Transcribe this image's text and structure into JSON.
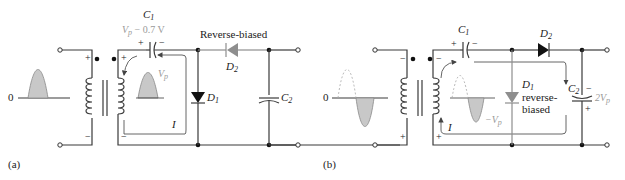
{
  "figure": {
    "panel_a": {
      "label": "(a)",
      "input_zero": "0",
      "primary_top_polarity": "+",
      "primary_bottom_polarity": "−",
      "secondary_top_polarity": "+",
      "secondary_bottom_polarity": "−",
      "c1": {
        "name": "C",
        "sub": "1",
        "voltage_label": "V",
        "voltage_sub": "p",
        "voltage_suffix": " − 0.7 V",
        "plus": "+",
        "minus": "−"
      },
      "vp_label": "V",
      "vp_sub": "p",
      "d1": {
        "name": "D",
        "sub": "1"
      },
      "d2": {
        "name": "D",
        "sub": "2",
        "status": "Reverse-biased"
      },
      "c2": {
        "name": "C",
        "sub": "2"
      },
      "current": "I"
    },
    "panel_b": {
      "label": "(b)",
      "input_zero": "0",
      "primary_top_polarity": "−",
      "primary_bottom_polarity": "+",
      "secondary_top_polarity": "−",
      "secondary_bottom_polarity": "+",
      "c1": {
        "name": "C",
        "sub": "1",
        "plus": "+",
        "minus": "−"
      },
      "neg_vp_label": "−V",
      "neg_vp_sub": "p",
      "d1": {
        "name": "D",
        "sub": "1",
        "status_line1": "reverse-",
        "status_line2": "biased"
      },
      "d2": {
        "name": "D",
        "sub": "2"
      },
      "c2": {
        "name": "C",
        "sub": "2",
        "voltage_label": "2V",
        "voltage_sub": "p",
        "plus": "+",
        "minus": "−"
      },
      "current": "I"
    },
    "colors": {
      "wire": "#3a3a3a",
      "gray_component": "#8e8e8e",
      "fill_wave": "#c8c8c8"
    }
  }
}
